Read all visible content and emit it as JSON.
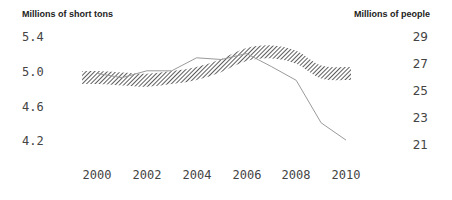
{
  "chart_data": {
    "type": "line",
    "title": "",
    "left_axis": {
      "label": "Millions of short tons",
      "ticks": [
        "5.4",
        "5.0",
        "4.6",
        "4.2"
      ],
      "range": [
        4.2,
        5.4
      ]
    },
    "right_axis": {
      "label": "Millions of people",
      "ticks": [
        "29",
        "27",
        "25",
        "23",
        "21"
      ],
      "range": [
        21,
        29
      ]
    },
    "x_ticks": [
      "2000",
      "2002",
      "2004",
      "2006",
      "2008",
      "2010"
    ],
    "x": [
      2000,
      2001,
      2002,
      2003,
      2004,
      2005,
      2006,
      2007,
      2008,
      2009,
      2010
    ],
    "series": [
      {
        "name": "Short tons (thin line, left axis)",
        "axis": "left",
        "style": "thin gray line",
        "values": [
          4.98,
          4.93,
          5.01,
          5.01,
          5.16,
          5.14,
          5.21,
          5.06,
          4.9,
          4.41,
          4.21
        ]
      },
      {
        "name": "People (hatched band, right axis)",
        "axis": "right",
        "style": "diagonal hatched band",
        "values": [
          26.0,
          25.9,
          25.8,
          26.0,
          26.3,
          26.9,
          27.7,
          27.9,
          27.5,
          26.4,
          26.3
        ]
      }
    ],
    "grid": false,
    "legend": "none"
  },
  "labels": {
    "left_title": "Millions of short tons",
    "right_title": "Millions of people",
    "left_ticks": [
      "5.4",
      "5.0",
      "4.6",
      "4.2"
    ],
    "right_ticks": [
      "29",
      "27",
      "25",
      "23",
      "21"
    ],
    "x_ticks": [
      "2000",
      "2002",
      "2004",
      "2006",
      "2008",
      "2010"
    ]
  },
  "colors": {
    "line": "#9a9a9a",
    "hatch": "#333333",
    "text": "#444444",
    "title": "#222222"
  }
}
